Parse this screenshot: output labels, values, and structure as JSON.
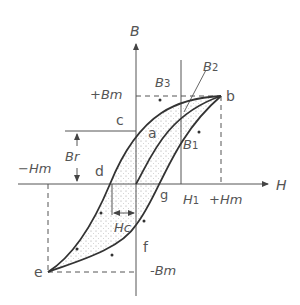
{
  "diagram": {
    "axes": {
      "x_label": "H",
      "y_label": "B"
    },
    "labels": {
      "plus_bm": "+Bm",
      "minus_bm": "-Bm",
      "plus_hm": "+Hm",
      "minus_hm": "−Hm",
      "h1": "H",
      "h1_sub": "1",
      "br": "Br",
      "hc": "Hc",
      "b1": "B",
      "b1_sub": "1",
      "b2": "B",
      "b2_sub": "2",
      "b3": "B",
      "b3_sub": "3"
    },
    "points": {
      "a": "a",
      "b": "b",
      "c": "c",
      "d": "d",
      "e": "e",
      "f": "f",
      "g": "g"
    },
    "colors": {
      "curve": "#333333",
      "axis": "#555555",
      "fill_dots": "#9a9a9a",
      "text": "#555555"
    }
  }
}
